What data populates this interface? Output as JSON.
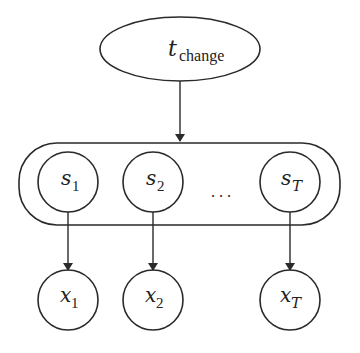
{
  "diagram": {
    "type": "graphical-model",
    "top_node": {
      "base": "t",
      "sub": "change"
    },
    "state_nodes": [
      {
        "base": "s",
        "sub": "1"
      },
      {
        "base": "s",
        "sub": "2"
      },
      {
        "base": "s",
        "sub": "T"
      }
    ],
    "ellipsis": ". . .",
    "obs_nodes": [
      {
        "base": "x",
        "sub": "1"
      },
      {
        "base": "x",
        "sub": "2"
      },
      {
        "base": "x",
        "sub": "T"
      }
    ],
    "edges": [
      {
        "from": "t_change",
        "to": "state_group"
      },
      {
        "from": "s_1",
        "to": "x_1"
      },
      {
        "from": "s_2",
        "to": "x_2"
      },
      {
        "from": "s_T",
        "to": "x_T"
      }
    ],
    "colors": {
      "stroke": "#2a2a2a",
      "background": "#ffffff"
    }
  }
}
